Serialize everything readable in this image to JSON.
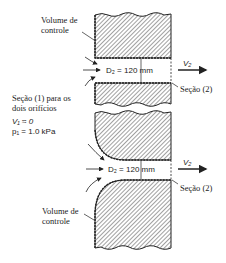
{
  "labels": {
    "control_volume_top_line1": "Volume de",
    "control_volume_top_line2": "controle",
    "control_volume_bottom_line1": "Volume de",
    "control_volume_bottom_line2": "controle",
    "section1_line1": "Seção (1) para os",
    "section1_line2": "dois orifícios",
    "v1": "V₁ ≈ 0",
    "p1": "p₁ = 1.0 kPa",
    "d2_top": "D₂ = 120 mm",
    "d2_bottom": "D₂ = 120 mm",
    "v2_top": "V₂",
    "v2_bottom": "V₂",
    "section2_top": "Seção (2)",
    "section2_bottom": "Seção (2)"
  },
  "colors": {
    "hatch": "#333333",
    "background": "#ffffff"
  }
}
